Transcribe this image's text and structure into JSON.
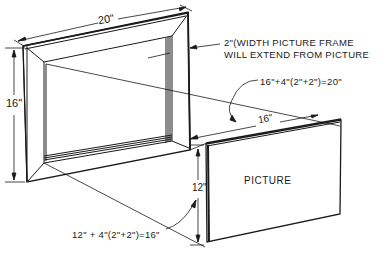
{
  "diagram": {
    "type": "technical-illustration",
    "frame": {
      "width_label": "20\"",
      "height_label": "16\""
    },
    "picture": {
      "label": "PICTURE",
      "width_label": "16\"",
      "height_label": "12\""
    },
    "notes": {
      "frame_width_line1": "2\"(WIDTH PICTURE FRAME",
      "frame_width_line2": "WILL EXTEND FROM PICTURE",
      "width_formula": "16\"+4\"(2\"+2\")=20\"",
      "height_formula": "12\" + 4\"(2\"+2\")=16\""
    },
    "colors": {
      "line": "#1a1a1a",
      "background": "#ffffff"
    }
  }
}
